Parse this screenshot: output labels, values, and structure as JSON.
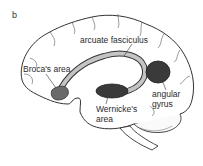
{
  "figure": {
    "panel_letter": "b",
    "labels": {
      "arcuate": "arcuate fasciculus",
      "broca": "Broca's area",
      "angular_line1": "angular",
      "angular_line2": "gyrus",
      "wernicke_line1": "Wernicke's",
      "wernicke_line2": "area"
    },
    "colors": {
      "outline": "#333333",
      "region_fill": "#3a3a3a",
      "broca_fill": "#6a6a6a",
      "tract_fill": "#bdbdbd",
      "background": "#ffffff"
    }
  }
}
